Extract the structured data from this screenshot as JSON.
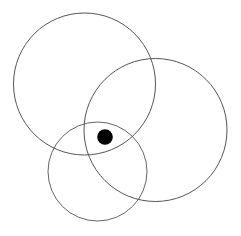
{
  "diagram": {
    "background": "#ffffff",
    "stroke_color": "#555555",
    "circles": [
      {
        "id": "circle-top-left",
        "cx": 84.5,
        "cy": 84,
        "r": 71,
        "stroke_width": 1
      },
      {
        "id": "circle-right",
        "cx": 155.5,
        "cy": 130,
        "r": 71.5,
        "stroke_width": 1
      },
      {
        "id": "circle-bottom",
        "cx": 97.5,
        "cy": 171.5,
        "r": 49.5,
        "stroke_width": 0.9
      }
    ],
    "dot": {
      "cx": 105,
      "cy": 137,
      "r": 7.8,
      "fill": "#000000"
    }
  }
}
